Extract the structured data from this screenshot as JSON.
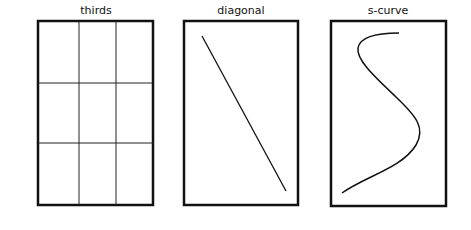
{
  "panels": [
    {
      "id": "thirds",
      "label": "thirds",
      "frame": {
        "x": 38,
        "y": 21,
        "w": 115,
        "h": 184
      },
      "grid": {
        "verticals": [
          79,
          116
        ],
        "horizontals": [
          83,
          143
        ]
      }
    },
    {
      "id": "diagonal",
      "label": "diagonal",
      "frame": {
        "x": 184,
        "y": 21,
        "w": 114,
        "h": 184
      },
      "line": {
        "x1": 202,
        "y1": 36,
        "x2": 286,
        "y2": 191
      }
    },
    {
      "id": "s-curve",
      "label": "s-curve",
      "frame": {
        "x": 331,
        "y": 21,
        "w": 115,
        "h": 185
      },
      "path": "M399,33 C380,33 360,36 358,48 C356,60 376,78 396,97 C416,116 426,128 416,145 C402,168 366,176 342,193"
    }
  ],
  "colors": {
    "stroke": "#111111",
    "background": "#ffffff"
  }
}
